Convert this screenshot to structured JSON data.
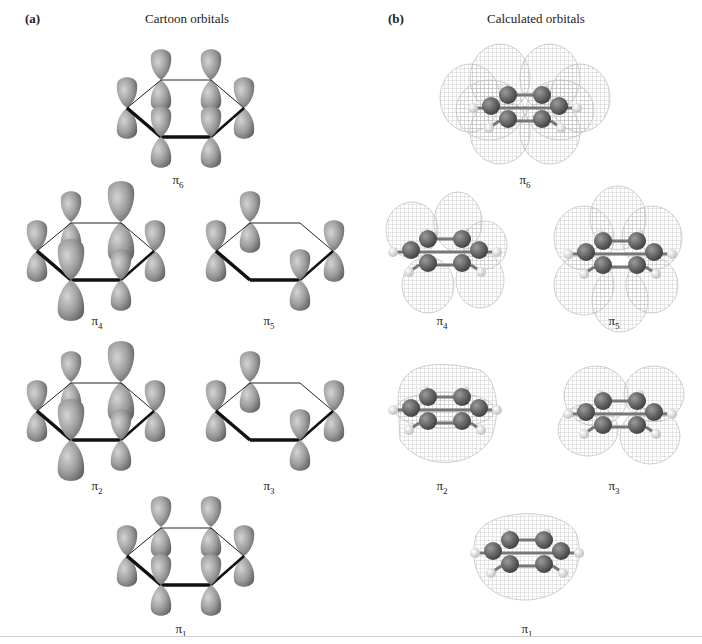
{
  "figure": {
    "panel_a": {
      "letter": "(a)",
      "title": "Cartoon orbitals",
      "orbitals": [
        {
          "id": "pi6",
          "symbol": "π",
          "subscript": "6"
        },
        {
          "id": "pi4",
          "symbol": "π",
          "subscript": "4"
        },
        {
          "id": "pi5",
          "symbol": "π",
          "subscript": "5"
        },
        {
          "id": "pi2",
          "symbol": "π",
          "subscript": "2"
        },
        {
          "id": "pi3",
          "symbol": "π",
          "subscript": "3"
        },
        {
          "id": "pi1",
          "symbol": "π",
          "subscript": "1"
        }
      ]
    },
    "panel_b": {
      "letter": "(b)",
      "title": "Calculated orbitals",
      "orbitals": [
        {
          "id": "pi6",
          "symbol": "π",
          "subscript": "6"
        },
        {
          "id": "pi4",
          "symbol": "π",
          "subscript": "4"
        },
        {
          "id": "pi5",
          "symbol": "π",
          "subscript": "5"
        },
        {
          "id": "pi2",
          "symbol": "π",
          "subscript": "2"
        },
        {
          "id": "pi3",
          "symbol": "π",
          "subscript": "3"
        },
        {
          "id": "pi1",
          "symbol": "π",
          "subscript": "1"
        }
      ]
    },
    "colors": {
      "lobe_dark": "#6e6e6e",
      "lobe_light": "#b4b4b4",
      "bond": "#111111",
      "mesh": "#9a9a9a",
      "carbon": "#555555",
      "hydrogen": "#e6e6e6"
    }
  }
}
